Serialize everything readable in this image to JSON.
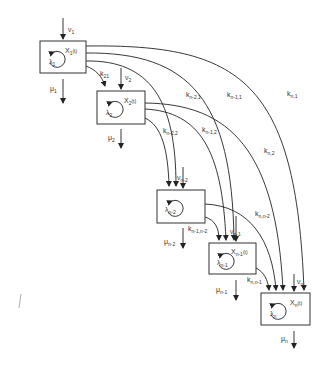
{
  "diagram": {
    "compartments": [
      {
        "id": "1",
        "state": "X",
        "state_sub": "1",
        "state_arg": "(t)",
        "self_label": "λ",
        "self_sub": "1",
        "input_label": "ν",
        "input_sub": "1",
        "output_label": "μ",
        "output_sub": "1"
      },
      {
        "id": "2",
        "state": "X",
        "state_sub": "2",
        "state_arg": "(t)",
        "self_label": "λ",
        "self_sub": "2",
        "input_label": "ν",
        "input_sub": "2",
        "output_label": "μ",
        "output_sub": "2"
      },
      {
        "id": "n-2",
        "state": "",
        "state_sub": "",
        "state_arg": "",
        "self_label": "λ",
        "self_sub": "n-2",
        "input_label": "ν",
        "input_sub": "n-2",
        "output_label": "μ",
        "output_sub": "n-2"
      },
      {
        "id": "n-1",
        "state": "X",
        "state_sub": "n-1",
        "state_arg": "(t)",
        "self_label": "λ",
        "self_sub": "n-1",
        "input_label": "ν",
        "input_sub": "n-1",
        "output_label": "μ",
        "output_sub": "n-1"
      },
      {
        "id": "n",
        "state": "X",
        "state_sub": "n",
        "state_arg": "(t)",
        "self_label": "λ",
        "self_sub": "n",
        "input_label": "ν",
        "input_sub": "n",
        "output_label": "μ",
        "output_sub": "n"
      }
    ],
    "transitions": [
      {
        "from": "1",
        "to": "2",
        "label": "k",
        "sub": "21"
      },
      {
        "from": "1",
        "to": "n-2",
        "label": "k",
        "sub": "n-2,1"
      },
      {
        "from": "1",
        "to": "n-1",
        "label": "k",
        "sub": "n-1,1"
      },
      {
        "from": "1",
        "to": "n",
        "label": "k",
        "sub": "n,1"
      },
      {
        "from": "2",
        "to": "n-2",
        "label": "k",
        "sub": "n-2,2"
      },
      {
        "from": "2",
        "to": "n-1",
        "label": "k",
        "sub": "n-1,2"
      },
      {
        "from": "2",
        "to": "n",
        "label": "k",
        "sub": "n,2"
      },
      {
        "from": "n-2",
        "to": "n-1",
        "label": "k",
        "sub": "n-1,n-2"
      },
      {
        "from": "n-2",
        "to": "n",
        "label": "k",
        "sub": "n,n-2"
      },
      {
        "from": "n-1",
        "to": "n",
        "label": "k",
        "sub": "n,n-1"
      }
    ],
    "colors": {
      "line": "#222222",
      "text": "#333333",
      "background": "#ffffff"
    }
  }
}
